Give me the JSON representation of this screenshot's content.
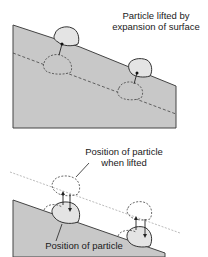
{
  "top_panel": {
    "label_line1": "Particle lifted by",
    "label_line2": "expansion of surface"
  },
  "bottom_panel": {
    "lifted_label_line1": "Position of particle",
    "lifted_label_line2": "when lifted",
    "settled_label": "Position of particle"
  },
  "colors": {
    "ground": "#c8c8c8",
    "particle": "#e4e4e4",
    "outline": "#333333"
  }
}
